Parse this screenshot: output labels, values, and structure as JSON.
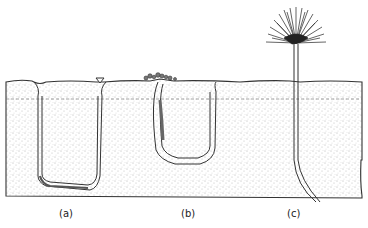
{
  "figure": {
    "panels": [
      {
        "id": "a",
        "label": "(a)",
        "description": "U-shaped burrow with two openings, funnel and mound"
      },
      {
        "id": "b",
        "label": "(b)",
        "description": "U-shaped burrow with fecal cast mound at surface"
      },
      {
        "id": "c",
        "label": "(c)",
        "description": "Vertical tube with fan-shaped tentacle crown above surface"
      }
    ]
  },
  "colors": {
    "ink": "#222222",
    "background": "#ffffff",
    "sediment_dot": "#555555"
  }
}
